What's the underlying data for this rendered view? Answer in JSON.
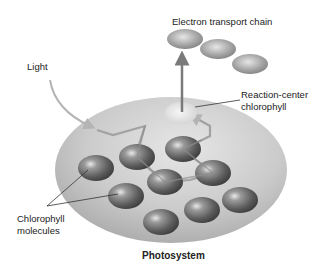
{
  "labels": {
    "electron_transport_chain": "Electron transport chain",
    "light": "Light",
    "reaction_center_line1": "Reaction-center",
    "reaction_center_line2": "chlorophyll",
    "chlorophyll_line1": "Chlorophyll",
    "chlorophyll_line2": "molecules",
    "photosystem": "Photosystem"
  },
  "colors": {
    "background": "#ffffff",
    "photosystem_disc": "#c8c8c8",
    "chlorophyll_dark": "#5a5a5a",
    "chlorophyll_light": "#d8d8d8",
    "arrow": "#7a7a7a",
    "energy_path": "#a0a0a0",
    "text": "#222222"
  },
  "elements": {
    "chlorophyll_count": 9,
    "electron_carriers": 3
  }
}
